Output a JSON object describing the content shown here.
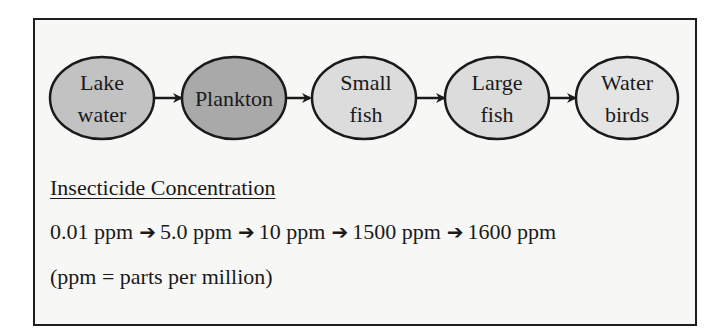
{
  "food_chain": {
    "nodes": [
      {
        "label_lines": [
          "Lake",
          "water"
        ],
        "fill": "#c2c2c2"
      },
      {
        "label_lines": [
          "Plankton"
        ],
        "fill": "#a9a9a9"
      },
      {
        "label_lines": [
          "Small",
          "fish"
        ],
        "fill": "#dcdcdc"
      },
      {
        "label_lines": [
          "Large",
          "fish"
        ],
        "fill": "#dcdcdc"
      },
      {
        "label_lines": [
          "Water",
          "birds"
        ],
        "fill": "#e4e4e4"
      }
    ],
    "arrow_icon": "right-arrow-icon"
  },
  "concentration": {
    "heading": "Insecticide Concentration",
    "values": [
      "0.01 ppm",
      "5.0 ppm",
      "10 ppm",
      "1500 ppm",
      "1600 ppm"
    ],
    "arrow_glyph": "➔",
    "note": "(ppm = parts per million)"
  },
  "colors": {
    "border": "#1e1e1e",
    "panel_bg": "#f7f7f5",
    "text": "#1a1a1a"
  }
}
